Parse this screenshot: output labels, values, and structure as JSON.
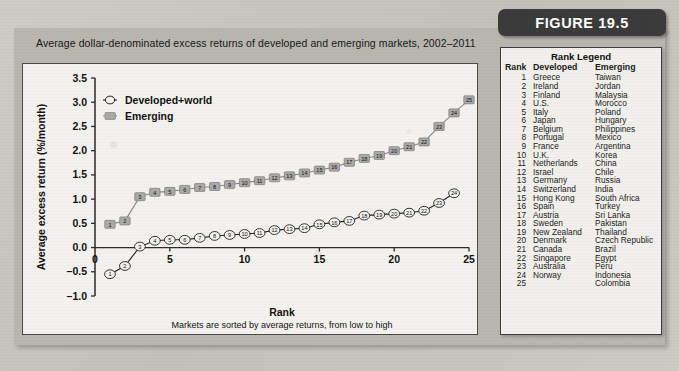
{
  "figure": {
    "badge_label": "FIGURE 19.5"
  },
  "banner": {
    "title": "Average dollar-denominated excess returns of developed and emerging markets, 2002–2011"
  },
  "legend_box": {
    "title": "Rank Legend",
    "columns": [
      "Rank",
      "Developed",
      "Emerging"
    ],
    "rows": [
      [
        "1",
        "Greece",
        "Taiwan"
      ],
      [
        "2",
        "Ireland",
        "Jordan"
      ],
      [
        "3",
        "Finland",
        "Malaysia"
      ],
      [
        "4",
        "U.S.",
        "Morocco"
      ],
      [
        "5",
        "Italy",
        "Poland"
      ],
      [
        "6",
        "Japan",
        "Hungary"
      ],
      [
        "7",
        "Belgium",
        "Philippines"
      ],
      [
        "8",
        "Portugal",
        "Mexico"
      ],
      [
        "9",
        "France",
        "Argentina"
      ],
      [
        "10",
        "U.K.",
        "Korea"
      ],
      [
        "11",
        "Netherlands",
        "China"
      ],
      [
        "12",
        "Israel",
        "Chile"
      ],
      [
        "13",
        "Germany",
        "Russia"
      ],
      [
        "14",
        "Switzerland",
        "India"
      ],
      [
        "15",
        "Hong Kong",
        "South Africa"
      ],
      [
        "16",
        "Spain",
        "Turkey"
      ],
      [
        "17",
        "Austria",
        "Sri Lanka"
      ],
      [
        "18",
        "Sweden",
        "Pakistan"
      ],
      [
        "19",
        "New Zealand",
        "Thailand"
      ],
      [
        "20",
        "Denmark",
        "Czech Republic"
      ],
      [
        "21",
        "Canada",
        "Brazil"
      ],
      [
        "22",
        "Singapore",
        "Egypt"
      ],
      [
        "23",
        "Australia",
        "Peru"
      ],
      [
        "24",
        "Norway",
        "Indonesia"
      ],
      [
        "25",
        "",
        "Colombia"
      ]
    ]
  },
  "chart_data": {
    "type": "line",
    "title": "",
    "xlabel": "Rank",
    "xlabel_sub": "Markets are sorted by average returns, from low to high",
    "ylabel": "Average excess return (%/month)",
    "xlim": [
      0,
      25
    ],
    "ylim": [
      -1.0,
      3.5
    ],
    "xticks": [
      0,
      5,
      10,
      15,
      20,
      25
    ],
    "xticklabels": [
      "0",
      "5",
      "10",
      "15",
      "20",
      "25"
    ],
    "yticks": [
      -1.0,
      -0.5,
      0.0,
      0.5,
      1.0,
      1.5,
      2.0,
      2.5,
      3.0,
      3.5
    ],
    "yticklabels": [
      "–1.0",
      "–0.5",
      "0.0",
      "0.5",
      "1.0",
      "1.5",
      "2.0",
      "2.5",
      "3.0",
      "3.5"
    ],
    "grid": false,
    "legend_position": "upper left",
    "series": [
      {
        "name": "Developed+world",
        "marker": "circle-open",
        "color": "#1a1a1a",
        "x": [
          1,
          2,
          3,
          4,
          5,
          6,
          7,
          8,
          9,
          10,
          11,
          12,
          13,
          14,
          15,
          16,
          17,
          18,
          19,
          20,
          21,
          22,
          23,
          24
        ],
        "values": [
          -0.55,
          -0.38,
          0.02,
          0.14,
          0.16,
          0.16,
          0.2,
          0.24,
          0.26,
          0.28,
          0.3,
          0.36,
          0.38,
          0.4,
          0.48,
          0.52,
          0.55,
          0.66,
          0.68,
          0.7,
          0.72,
          0.76,
          0.92,
          1.12
        ]
      },
      {
        "name": "Emerging",
        "marker": "square-filled",
        "color": "#8c8c8c",
        "x": [
          1,
          2,
          3,
          4,
          5,
          6,
          7,
          8,
          9,
          10,
          11,
          12,
          13,
          14,
          15,
          16,
          17,
          18,
          19,
          20,
          21,
          22,
          23,
          24,
          25
        ],
        "values": [
          0.48,
          0.55,
          1.05,
          1.14,
          1.16,
          1.2,
          1.24,
          1.26,
          1.3,
          1.34,
          1.38,
          1.44,
          1.48,
          1.54,
          1.6,
          1.66,
          1.76,
          1.84,
          1.9,
          2.0,
          2.08,
          2.18,
          2.5,
          2.78,
          3.05
        ]
      }
    ]
  }
}
